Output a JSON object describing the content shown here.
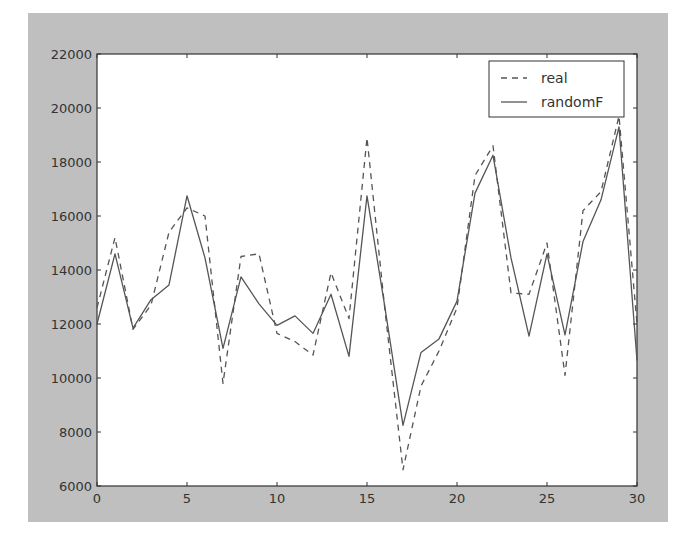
{
  "chart_data": {
    "type": "line",
    "title": "",
    "xlabel": "",
    "ylabel": "",
    "xlim": [
      0,
      30
    ],
    "ylim": [
      6000,
      22000
    ],
    "grid": false,
    "legend_position": "upper right",
    "x_ticks": [
      0,
      5,
      10,
      15,
      20,
      25,
      30
    ],
    "y_ticks": [
      6000,
      8000,
      10000,
      12000,
      14000,
      16000,
      18000,
      20000,
      22000
    ],
    "x": [
      0,
      1,
      2,
      3,
      4,
      5,
      6,
      7,
      8,
      9,
      10,
      11,
      12,
      13,
      14,
      15,
      16,
      17,
      18,
      19,
      20,
      21,
      22,
      23,
      24,
      25,
      26,
      27,
      28,
      29,
      30
    ],
    "series": [
      {
        "name": "real",
        "style": "dashed",
        "color": "#555555",
        "values": [
          12600,
          15200,
          11800,
          12700,
          15400,
          16300,
          16000,
          9800,
          14500,
          14600,
          11650,
          11350,
          10850,
          13900,
          12200,
          18900,
          12500,
          6600,
          9700,
          11000,
          12600,
          17500,
          18600,
          13150,
          13100,
          15000,
          10100,
          16200,
          16900,
          19700,
          12000
        ]
      },
      {
        "name": "randomF",
        "style": "solid",
        "color": "#555555",
        "values": [
          12000,
          14600,
          11850,
          12900,
          13450,
          16750,
          14450,
          11100,
          13750,
          12750,
          11950,
          12300,
          11650,
          13100,
          10800,
          16750,
          12600,
          8250,
          10950,
          11450,
          12850,
          16850,
          18250,
          14450,
          11550,
          14600,
          11600,
          15050,
          16600,
          19300,
          10650
        ]
      }
    ]
  },
  "legend": {
    "items": [
      {
        "label": "real",
        "style": "dashed"
      },
      {
        "label": "randomF",
        "style": "solid"
      }
    ]
  },
  "colors": {
    "figure_background": "#bfbfbf",
    "axes_background": "#ffffff",
    "line": "#555555",
    "axis": "#333333"
  }
}
